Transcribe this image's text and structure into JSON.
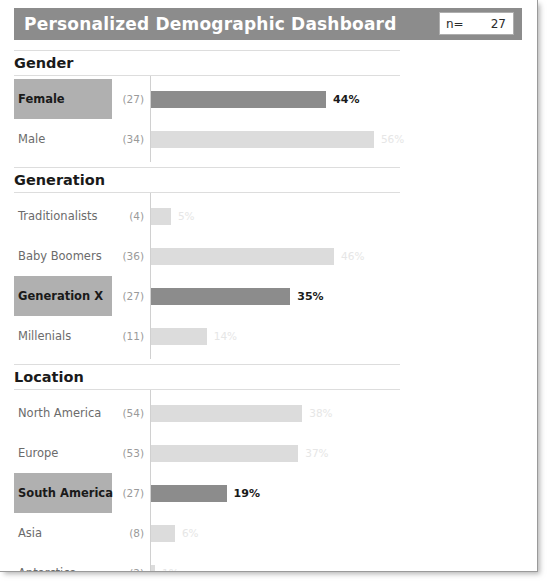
{
  "header": {
    "title": "Personalized Demographic Dashboard",
    "n_label": "n=",
    "n_value": "27"
  },
  "colors": {
    "header_bg": "#8c8c8c",
    "highlight_bar": "#8c8c8c",
    "muted_bar": "#dcdcdc",
    "highlight_label_bg": "#b0b0b0",
    "sheet_bg": "#ffffff"
  },
  "chart_data": {
    "type": "bar",
    "title": "Personalized Demographic Dashboard",
    "xlabel": "",
    "ylabel": "",
    "orientation": "horizontal",
    "grid": false,
    "legend": "none",
    "xlim": [
      0,
      100
    ],
    "sections": [
      {
        "title": "Gender",
        "categories": [
          "Female",
          "Male"
        ],
        "counts": [
          27,
          34
        ],
        "values": [
          44,
          56
        ],
        "labels": [
          "44%",
          "56%"
        ],
        "count_labels": [
          "(27)",
          "(34)"
        ],
        "highlighted": [
          "Female"
        ]
      },
      {
        "title": "Generation",
        "categories": [
          "Traditionalists",
          "Baby Boomers",
          "Generation X",
          "Millenials"
        ],
        "counts": [
          4,
          36,
          27,
          11
        ],
        "values": [
          5,
          46,
          35,
          14
        ],
        "labels": [
          "5%",
          "46%",
          "35%",
          "14%"
        ],
        "count_labels": [
          "(4)",
          "(36)",
          "(27)",
          "(11)"
        ],
        "highlighted": [
          "Generation X"
        ]
      },
      {
        "title": "Location",
        "categories": [
          "North America",
          "Europe",
          "South America",
          "Asia",
          "Antarctica"
        ],
        "counts": [
          54,
          53,
          27,
          8,
          2
        ],
        "values": [
          38,
          37,
          19,
          6,
          1
        ],
        "labels": [
          "38%",
          "37%",
          "19%",
          "6%",
          "1%"
        ],
        "count_labels": [
          "(54)",
          "(53)",
          "(27)",
          "(8)",
          "(2)"
        ],
        "highlighted": [
          "South America"
        ]
      }
    ]
  }
}
